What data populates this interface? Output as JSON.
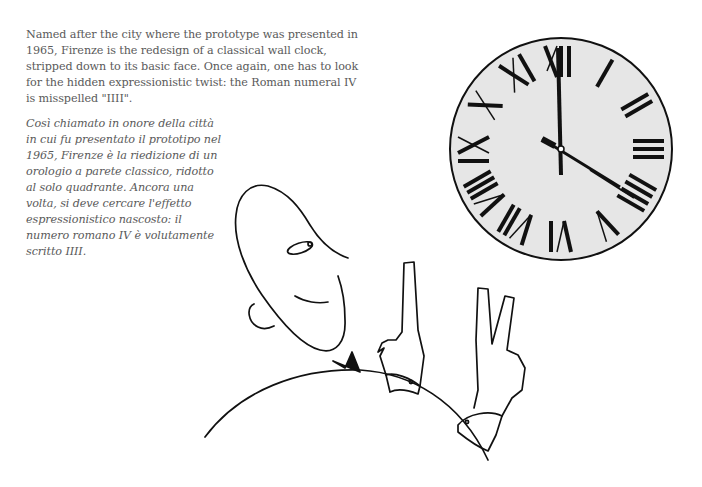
{
  "text": {
    "english": "Named after the city where the prototype was presented in 1965, Firenze is the redesign of a classical wall clock, stripped down to its basic face. Once again, one has to look for the hidden expressionistic twist: the Roman numeral IV is misspelled \"IIII\".",
    "italian": "Così chiamato in onore della città in cui fu presentato il prototipo nel 1965, Firenze è la riedizione di un orologio a parete classico, ridotto al solo quadrante. Ancora una volta, si deve cercare l'effetto espressionistico nascosto: il numero romano IV è volutamente scritto IIII."
  },
  "clock": {
    "numerals": [
      "XII",
      "I",
      "II",
      "III",
      "IIII",
      "V",
      "VI",
      "VII",
      "VIII",
      "IX",
      "X",
      "XI"
    ],
    "time": "4:00",
    "face_color": "#e6e6e6",
    "ink_color": "#111111"
  }
}
